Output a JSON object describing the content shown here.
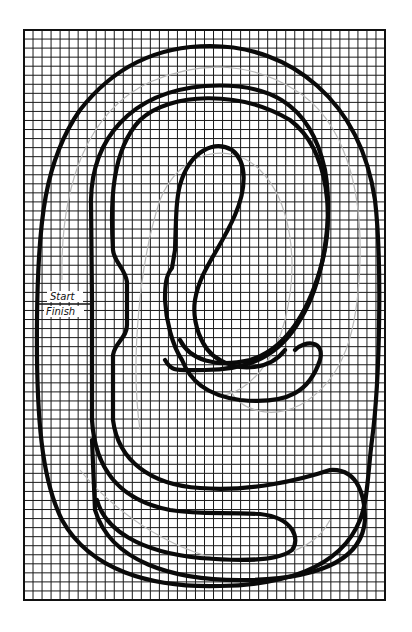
{
  "diagram": {
    "title": "",
    "type": "slot car race track layout on grid paper",
    "grid": {
      "x": 24,
      "y": 30,
      "width": 361,
      "height": 570,
      "cell": 9,
      "columns": 40,
      "rows": 63
    },
    "colors": {
      "track": "#0a0a0a",
      "grid": "#1a1a1a",
      "pencil": "#b8b8b8",
      "background": "#ffffff"
    },
    "labels": {
      "start": "Start",
      "finish": "Finish"
    },
    "track_lines": [
      {
        "name": "outer-edge"
      },
      {
        "name": "outer-lane-divider"
      },
      {
        "name": "inner-lane-divider"
      },
      {
        "name": "inner-edge"
      }
    ]
  }
}
